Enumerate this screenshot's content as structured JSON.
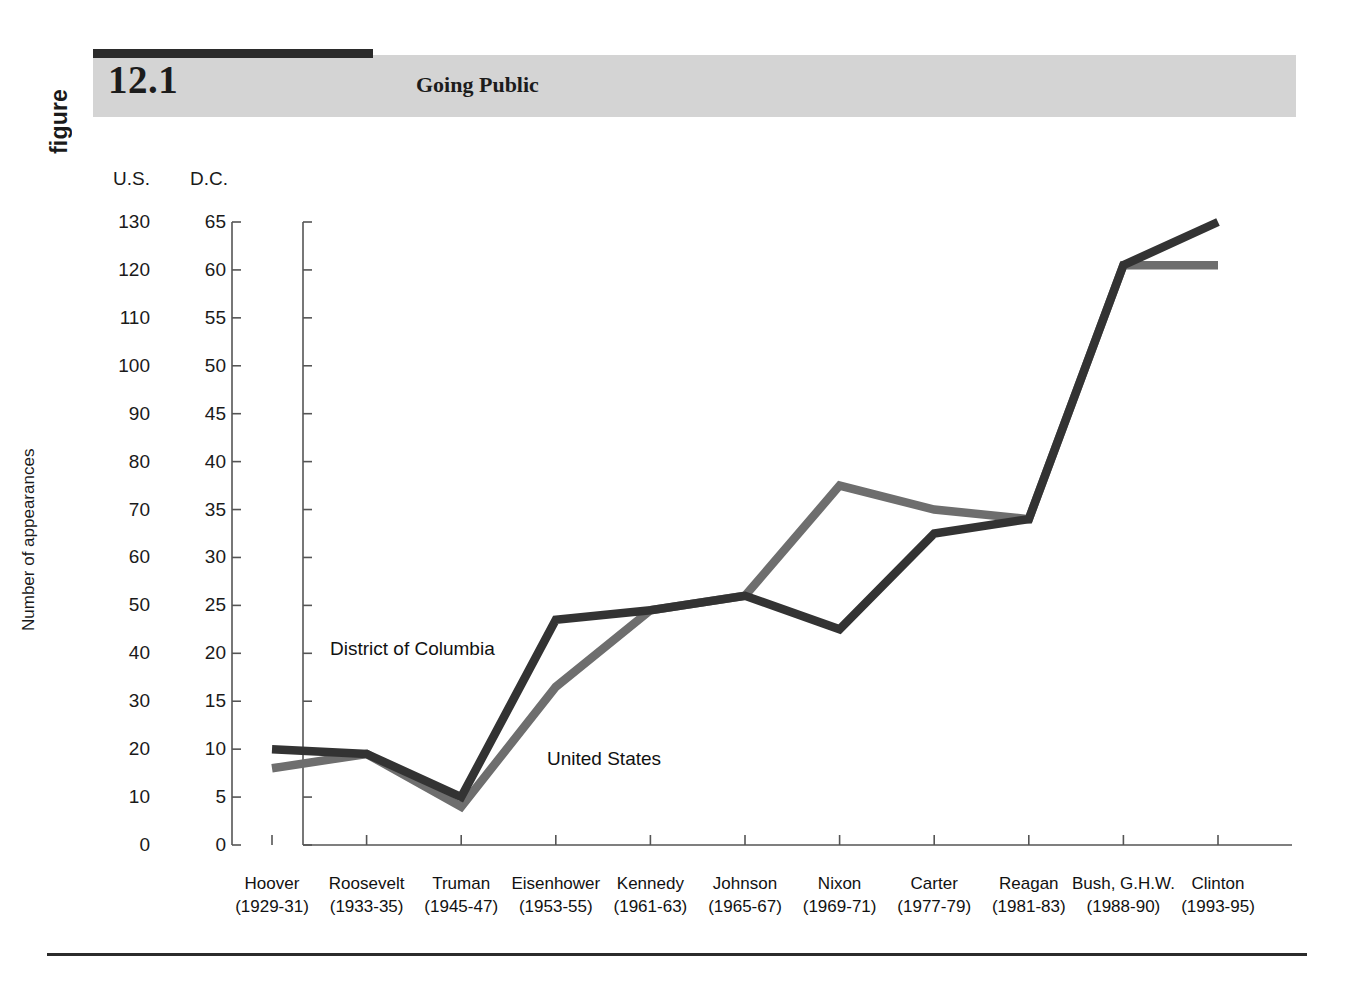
{
  "header": {
    "figure_word": "figure",
    "number": "12.1",
    "title": "Going Public"
  },
  "chart_data": {
    "type": "line",
    "title": "Going Public",
    "xlabel": "",
    "ylabel": "Number of appearances",
    "grid": false,
    "legend": "inline-series-labels",
    "categories": [
      "Hoover\n(1929-31)",
      "Roosevelt\n(1933-35)",
      "Truman\n(1945-47)",
      "Eisenhower\n(1953-55)",
      "Kennedy\n(1961-63)",
      "Johnson\n(1965-67)",
      "Nixon\n(1969-71)",
      "Carter\n(1977-79)",
      "Reagan\n(1981-83)",
      "Bush, G.H.W.\n(1988-90)",
      "Clinton\n(1993-95)"
    ],
    "category_names": [
      "Hoover",
      "Roosevelt",
      "Truman",
      "Eisenhower",
      "Kennedy",
      "Johnson",
      "Nixon",
      "Carter",
      "Reagan",
      "Bush, G.H.W.",
      "Clinton"
    ],
    "category_years": [
      "(1929-31)",
      "(1933-35)",
      "(1945-47)",
      "(1953-55)",
      "(1961-63)",
      "(1965-67)",
      "(1969-71)",
      "(1977-79)",
      "(1981-83)",
      "(1988-90)",
      "(1993-95)"
    ],
    "axes": [
      {
        "id": "us",
        "name": "U.S.",
        "label": "U.S.",
        "min": 0,
        "max": 130,
        "step": 10,
        "ticks": [
          130,
          120,
          110,
          100,
          90,
          80,
          70,
          60,
          50,
          40,
          30,
          20,
          10,
          0
        ]
      },
      {
        "id": "dc",
        "name": "D.C.",
        "label": "D.C.",
        "min": 0,
        "max": 65,
        "step": 5,
        "ticks": [
          65,
          60,
          55,
          50,
          45,
          40,
          35,
          30,
          25,
          20,
          15,
          10,
          5,
          0
        ]
      }
    ],
    "series": [
      {
        "name": "District of Columbia",
        "axis": "dc",
        "color": "#333333",
        "values": [
          10,
          9.5,
          5,
          23.5,
          24.5,
          26,
          22.5,
          32.5,
          34,
          60.5,
          65
        ]
      },
      {
        "name": "United States",
        "axis": "us",
        "color": "#6e6e6e",
        "values": [
          16,
          19,
          8,
          33,
          49,
          52,
          75,
          70,
          68,
          121,
          121
        ]
      }
    ]
  },
  "series_labels": {
    "dc": "District of Columbia",
    "us": "United States"
  }
}
